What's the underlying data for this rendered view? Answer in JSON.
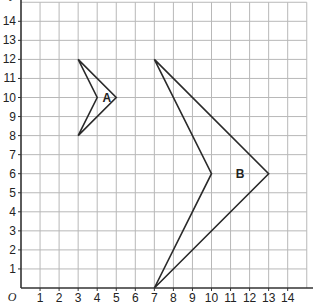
{
  "diagram": {
    "type": "coordinate-grid",
    "x_axis": {
      "label": "x",
      "min": 0,
      "max": 15,
      "ticks": [
        1,
        2,
        3,
        4,
        5,
        6,
        7,
        8,
        9,
        10,
        11,
        12,
        13,
        14
      ]
    },
    "y_axis": {
      "label": "y",
      "min": 0,
      "max": 15,
      "ticks": [
        1,
        2,
        3,
        4,
        5,
        6,
        7,
        8,
        9,
        10,
        11,
        12,
        13,
        14
      ]
    },
    "origin_label": "O",
    "shapes": [
      {
        "name": "A",
        "label": "A",
        "vertices": [
          [
            3,
            12
          ],
          [
            5,
            10
          ],
          [
            3,
            8
          ],
          [
            4,
            10
          ]
        ],
        "label_pos": [
          4.5,
          10
        ]
      },
      {
        "name": "B",
        "label": "B",
        "vertices": [
          [
            7,
            12
          ],
          [
            13,
            6
          ],
          [
            7,
            0
          ],
          [
            10,
            6
          ]
        ],
        "label_pos": [
          11.5,
          6
        ]
      }
    ],
    "colors": {
      "grid": "#b8b8b8",
      "axis": "#333333",
      "shape": "#2a2a2a"
    }
  }
}
